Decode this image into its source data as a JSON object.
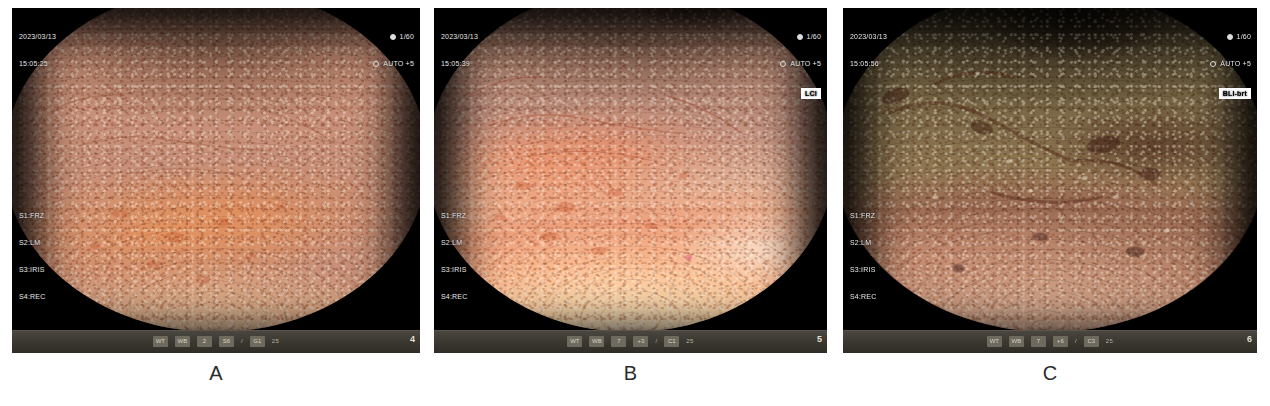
{
  "figure": {
    "panels": [
      {
        "id": "a",
        "caption": "A",
        "osd": {
          "date": "2023/03/13",
          "time": "15:05:25",
          "shutter": "1/60",
          "iris": "AUTO +5",
          "mode_badge": "",
          "softkeys": [
            "S1:FRZ",
            "S2:LM",
            "S3:IRIS",
            "S4:REC"
          ],
          "scope_id": "EG-L600WR7",
          "frame_number": "4"
        },
        "statusbar": {
          "items": [
            "WT",
            "WB",
            "2",
            "S6",
            "/",
            "G1",
            "25"
          ]
        }
      },
      {
        "id": "b",
        "caption": "B",
        "osd": {
          "date": "2023/03/13",
          "time": "15:05:39",
          "shutter": "1/60",
          "iris": "AUTO +5",
          "mode_badge": "LCI",
          "softkeys": [
            "S1:FRZ",
            "S2:LM",
            "S3:IRIS",
            "S4:REC"
          ],
          "scope_id": "EG-L600WR7",
          "frame_number": "5"
        },
        "statusbar": {
          "items": [
            "WT",
            "WB",
            "7",
            "+3",
            "/",
            "C1",
            "25"
          ]
        }
      },
      {
        "id": "c",
        "caption": "C",
        "osd": {
          "date": "2023/03/13",
          "time": "15:05:56",
          "shutter": "1/60",
          "iris": "AUTO +5",
          "mode_badge": "BLI-brt",
          "softkeys": [
            "S1:FRZ",
            "S2:LM",
            "S3:IRIS",
            "S4:REC"
          ],
          "scope_id": "EG-L600WR7",
          "frame_number": "6"
        },
        "statusbar": {
          "items": [
            "WT",
            "WB",
            "7",
            "+6",
            "/",
            "C3",
            "25"
          ]
        }
      }
    ]
  }
}
